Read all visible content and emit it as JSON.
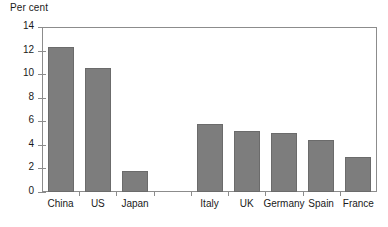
{
  "chart_data": {
    "type": "bar",
    "title": "",
    "subtitle": "",
    "xlabel": "",
    "ylabel": "Per cent",
    "ylim": [
      0,
      14
    ],
    "yticks": [
      0,
      2,
      4,
      6,
      8,
      10,
      12,
      14
    ],
    "ytick_labels": [
      "0",
      "2",
      "4",
      "6",
      "8",
      "10",
      "12",
      "14"
    ],
    "grid": false,
    "legend": false,
    "legend_position": "none",
    "bar_color": "#7d7d7d",
    "bar_edge_color": "#6b6b6b",
    "axis_color": "#8c8c8c",
    "group_gap_after": "Japan",
    "categories": [
      "China",
      "US",
      "Japan",
      "Italy",
      "UK",
      "Germany",
      "Spain",
      "France"
    ],
    "values": [
      12.3,
      10.5,
      1.8,
      5.8,
      5.2,
      5.0,
      4.4,
      3.0
    ],
    "points": [
      {
        "category": "China",
        "value": 12.3
      },
      {
        "category": "US",
        "value": 10.5
      },
      {
        "category": "Japan",
        "value": 1.8
      },
      {
        "category": "Italy",
        "value": 5.8
      },
      {
        "category": "UK",
        "value": 5.2
      },
      {
        "category": "Germany",
        "value": 5.0
      },
      {
        "category": "Spain",
        "value": 4.4
      },
      {
        "category": "France",
        "value": 3.0
      }
    ]
  }
}
